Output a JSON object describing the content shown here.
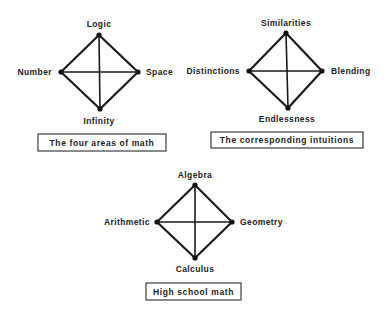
{
  "diagrams": [
    {
      "id": "four-areas",
      "caption": "The four areas of math",
      "caption_box": {
        "x": 38,
        "y": 134,
        "w": 128,
        "h": 17
      },
      "nodes": {
        "top": {
          "label": "Logic",
          "x": 99,
          "y": 35,
          "lx": 99,
          "ly": 27,
          "anchor": "middle"
        },
        "left": {
          "label": "Number",
          "x": 61,
          "y": 72,
          "lx": 52,
          "ly": 75,
          "anchor": "end"
        },
        "right": {
          "label": "Space",
          "x": 138,
          "y": 72,
          "lx": 146,
          "ly": 75,
          "anchor": "start"
        },
        "bottom": {
          "label": "Infinity",
          "x": 100,
          "y": 109,
          "lx": 99,
          "ly": 124,
          "anchor": "middle"
        }
      }
    },
    {
      "id": "intuitions",
      "caption": "The corresponding intuitions",
      "caption_box": {
        "x": 211,
        "y": 132,
        "w": 152,
        "h": 16
      },
      "nodes": {
        "top": {
          "label": "Similarities",
          "x": 286,
          "y": 33,
          "lx": 286,
          "ly": 26,
          "anchor": "middle"
        },
        "left": {
          "label": "Distinctions",
          "x": 249,
          "y": 71,
          "lx": 240,
          "ly": 74,
          "anchor": "end"
        },
        "right": {
          "label": "Blending",
          "x": 322,
          "y": 71,
          "lx": 331,
          "ly": 74,
          "anchor": "start"
        },
        "bottom": {
          "label": "Endlessness",
          "x": 288,
          "y": 108,
          "lx": 287,
          "ly": 122,
          "anchor": "middle"
        }
      }
    },
    {
      "id": "high-school",
      "caption": "High school math",
      "caption_box": {
        "x": 146,
        "y": 283,
        "w": 95,
        "h": 17
      },
      "nodes": {
        "top": {
          "label": "Algebra",
          "x": 195,
          "y": 185,
          "lx": 195,
          "ly": 178,
          "anchor": "middle"
        },
        "left": {
          "label": "Arithmetic",
          "x": 157,
          "y": 222,
          "lx": 150,
          "ly": 225,
          "anchor": "end"
        },
        "right": {
          "label": "Geometry",
          "x": 232,
          "y": 222,
          "lx": 240,
          "ly": 225,
          "anchor": "start"
        },
        "bottom": {
          "label": "Calculus",
          "x": 195,
          "y": 258,
          "lx": 195,
          "ly": 272,
          "anchor": "middle"
        }
      }
    }
  ]
}
